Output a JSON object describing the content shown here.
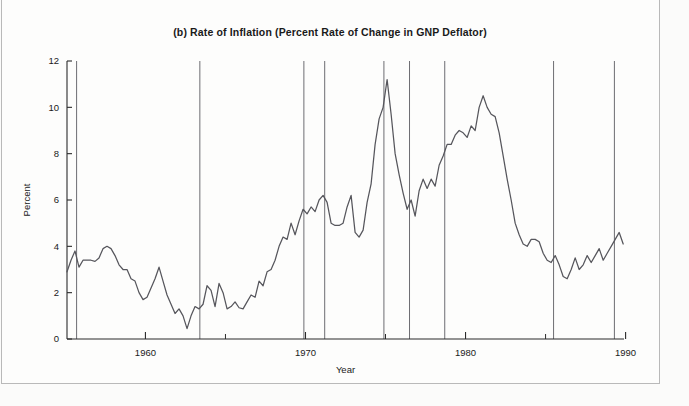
{
  "figure": {
    "title": "(b)  Rate of Inflation (Percent Rate of Change in GNP Deflator)",
    "panel_label": "(b)"
  },
  "chart_data": {
    "type": "line",
    "title": "(b)  Rate of Inflation (Percent Rate of Change in GNP Deflator)",
    "xlabel": "Year",
    "ylabel": "Percent",
    "xlim": [
      1955.1,
      1989.9
    ],
    "ylim": [
      0,
      12
    ],
    "xticks": [
      1960,
      1970,
      1980,
      1990
    ],
    "xtick_labels": [
      "1960",
      "1970",
      "1980",
      "1990"
    ],
    "xminor_ticks": [
      1955,
      1965,
      1975,
      1985
    ],
    "yticks": [
      0,
      2,
      4,
      6,
      8,
      10,
      12
    ],
    "ytick_labels": [
      "0",
      "2",
      "4",
      "6",
      "8",
      "10",
      "12"
    ],
    "grid": false,
    "legend": "none",
    "series": [
      {
        "name": "Rate of Inflation (GNP Deflator)",
        "color": "#56565c",
        "x": [
          1955.1,
          1955.35,
          1955.6,
          1955.85,
          1956.1,
          1956.35,
          1956.6,
          1956.85,
          1957.1,
          1957.35,
          1957.6,
          1957.85,
          1958.1,
          1958.35,
          1958.6,
          1958.85,
          1959.1,
          1959.35,
          1959.6,
          1959.85,
          1960.1,
          1960.35,
          1960.6,
          1960.85,
          1961.1,
          1961.35,
          1961.6,
          1961.85,
          1962.1,
          1962.35,
          1962.6,
          1962.85,
          1963.1,
          1963.35,
          1963.6,
          1963.85,
          1964.1,
          1964.35,
          1964.6,
          1964.85,
          1965.1,
          1965.35,
          1965.6,
          1965.85,
          1966.1,
          1966.35,
          1966.6,
          1966.85,
          1967.1,
          1967.35,
          1967.6,
          1967.85,
          1968.1,
          1968.35,
          1968.6,
          1968.85,
          1969.1,
          1969.35,
          1969.6,
          1969.85,
          1970.1,
          1970.35,
          1970.6,
          1970.85,
          1971.1,
          1971.35,
          1971.6,
          1971.85,
          1972.1,
          1972.35,
          1972.6,
          1972.85,
          1973.1,
          1973.35,
          1973.6,
          1973.85,
          1974.1,
          1974.35,
          1974.6,
          1974.85,
          1975.1,
          1975.35,
          1975.6,
          1975.85,
          1976.1,
          1976.35,
          1976.6,
          1976.85,
          1977.1,
          1977.35,
          1977.6,
          1977.85,
          1978.1,
          1978.35,
          1978.6,
          1978.85,
          1979.1,
          1979.35,
          1979.6,
          1979.85,
          1980.1,
          1980.35,
          1980.6,
          1980.85,
          1981.1,
          1981.35,
          1981.6,
          1981.85,
          1982.1,
          1982.35,
          1982.6,
          1982.85,
          1983.1,
          1983.35,
          1983.6,
          1983.85,
          1984.1,
          1984.35,
          1984.6,
          1984.85,
          1985.1,
          1985.35,
          1985.6,
          1985.85,
          1986.1,
          1986.35,
          1986.6,
          1986.85,
          1987.1,
          1987.35,
          1987.6,
          1987.85,
          1988.1,
          1988.35,
          1988.6,
          1988.85,
          1989.1,
          1989.35,
          1989.6,
          1989.85
        ],
        "y": [
          2.9,
          3.4,
          3.8,
          3.1,
          3.4,
          3.4,
          3.4,
          3.35,
          3.5,
          3.9,
          4.0,
          3.9,
          3.6,
          3.2,
          3.0,
          3.0,
          2.6,
          2.5,
          2.0,
          1.7,
          1.8,
          2.2,
          2.6,
          3.1,
          2.5,
          1.9,
          1.5,
          1.1,
          1.3,
          1.0,
          0.45,
          1.0,
          1.4,
          1.3,
          1.5,
          2.3,
          2.1,
          1.4,
          2.4,
          2.0,
          1.3,
          1.4,
          1.6,
          1.35,
          1.3,
          1.6,
          1.9,
          1.8,
          2.5,
          2.3,
          2.9,
          3.0,
          3.4,
          4.0,
          4.4,
          4.3,
          5.0,
          4.5,
          5.1,
          5.6,
          5.4,
          5.7,
          5.5,
          6.0,
          6.2,
          5.9,
          5.0,
          4.9,
          4.9,
          5.0,
          5.7,
          6.2,
          4.6,
          4.4,
          4.7,
          5.9,
          6.7,
          8.4,
          9.5,
          10.0,
          11.2,
          9.7,
          8.0,
          7.1,
          6.3,
          5.6,
          6.0,
          5.3,
          6.4,
          6.9,
          6.5,
          6.9,
          6.6,
          7.5,
          7.9,
          8.4,
          8.4,
          8.8,
          9.0,
          8.9,
          8.7,
          9.2,
          9.0,
          10.0,
          10.5,
          10.0,
          9.7,
          9.6,
          8.9,
          7.9,
          6.9,
          6.0,
          5.0,
          4.5,
          4.1,
          4.0,
          4.3,
          4.3,
          4.2,
          3.7,
          3.4,
          3.3,
          3.6,
          3.2,
          2.7,
          2.6,
          3.0,
          3.5,
          3.0,
          3.2,
          3.6,
          3.3,
          3.6,
          3.9,
          3.4,
          3.7,
          4.0,
          4.3,
          4.6,
          4.1
        ]
      }
    ],
    "recession_lines_x": [
      1955.7,
      1963.4,
      1969.9,
      1971.2,
      1974.9,
      1976.5,
      1978.7,
      1985.5,
      1989.3
    ],
    "recession_line_color": "#6d6d72"
  }
}
